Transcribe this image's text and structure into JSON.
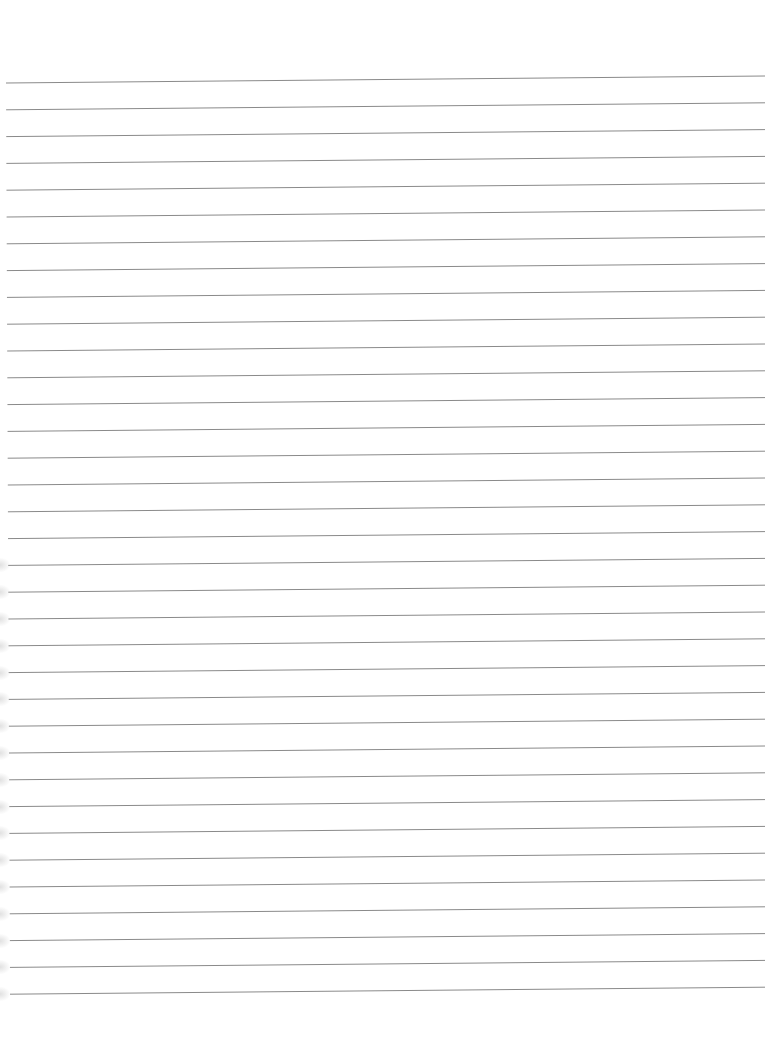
{
  "page": {
    "type": "lined-paper",
    "background_color": "#ffffff",
    "line_color": "#8a8a8a",
    "line_count": 35,
    "first_line_left_y": 83,
    "first_line_right_y": 76,
    "line_spacing": 26.8,
    "line_start_x": 6,
    "line_end_x": 765,
    "edge_shadow_color": "#d0d0d0"
  }
}
